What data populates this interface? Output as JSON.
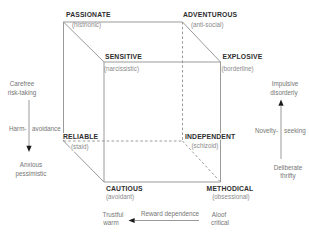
{
  "figure": {
    "colors": {
      "background": "#ffffff",
      "line": "#8f8f8f",
      "main_label": "#2e2e2e",
      "sub_label": "#8a8a8a",
      "axis_text": "#757575",
      "arrow": "#1a1a1a"
    }
  },
  "cube": {
    "passionate": {
      "name": "PASSIONATE",
      "type": "(histrionic)"
    },
    "adventurous": {
      "name": "ADVENTUROUS",
      "type": "(anti-social)"
    },
    "sensitive": {
      "name": "SENSITIVE",
      "type": "(narcissistic)"
    },
    "explosive": {
      "name": "EXPLOSIVE",
      "type": "(borderline)"
    },
    "reliable": {
      "name": "RELIABLE",
      "type": "(staid)"
    },
    "independent": {
      "name": "INDEPENDENT",
      "type": "(schizoid)"
    },
    "cautious": {
      "name": "CAUTIOUS",
      "type": "(avoidant)"
    },
    "methodical": {
      "name": "METHODICAL",
      "type": "(obsessional)"
    }
  },
  "axes": {
    "harm_avoidance": {
      "label_left": "Harm-",
      "label_right": "avoidance",
      "pole_top": [
        "Carefree",
        "risk-taking"
      ],
      "pole_bottom": [
        "Anxious",
        "pessimistic"
      ],
      "arrow_direction": "down"
    },
    "novelty_seeking": {
      "label_left": "Novelty-",
      "label_right": "seeking",
      "pole_top": [
        "Impulsive",
        "disorderly"
      ],
      "pole_bottom": [
        "Deliberate",
        "thrifty"
      ],
      "arrow_direction": "up"
    },
    "reward_dependence": {
      "label": "Reward dependence",
      "pole_left": [
        "Trustful",
        "warm"
      ],
      "pole_right": [
        "Aloof",
        "critical"
      ],
      "arrow_direction": "left"
    }
  }
}
